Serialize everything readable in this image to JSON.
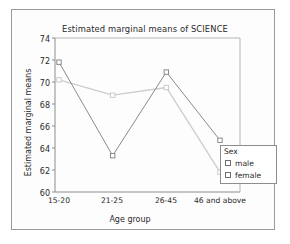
{
  "chart_data": {
    "type": "line",
    "title": "Estimated marginal means of SCIENCE",
    "xlabel": "Age group",
    "ylabel": "Estimated marginal means",
    "categories": [
      "15-20",
      "21-25",
      "26-45",
      "46 and above"
    ],
    "ylim": [
      60,
      74
    ],
    "yticks": [
      60,
      62,
      64,
      66,
      68,
      70,
      72,
      74
    ],
    "grid": false,
    "legend": {
      "title": "Sex",
      "position": "right-inside",
      "entries": [
        "male",
        "female"
      ]
    },
    "series": [
      {
        "name": "male",
        "values": [
          71.8,
          63.3,
          70.9,
          64.7
        ],
        "color": "#8a8a8a",
        "marker": "open-square"
      },
      {
        "name": "female",
        "values": [
          70.2,
          68.8,
          69.5,
          61.8
        ],
        "color": "#cccccc",
        "marker": "open-square"
      }
    ]
  },
  "legend": {
    "title": "Sex",
    "male_label": "male",
    "female_label": "female"
  },
  "axes": {
    "y_ticks": [
      "74",
      "72",
      "70",
      "68",
      "66",
      "64",
      "62",
      "60"
    ],
    "x_ticks": [
      "15-20",
      "21-25",
      "26-45",
      "46 and above"
    ]
  },
  "colors": {
    "male_line": "#8a8a8a",
    "female_line": "#cccccc",
    "axis": "#8d8d8d",
    "text": "#2a2a2a",
    "frame": "#9a9a9a"
  }
}
